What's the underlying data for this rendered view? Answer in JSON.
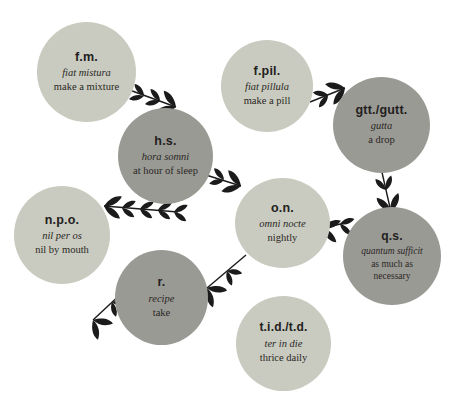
{
  "diagram": {
    "colors": {
      "light_node": "#c9cbc0",
      "dark_node": "#9a9a95",
      "text": "#2a2724",
      "background": "#ffffff",
      "arrow": "#1b1b1b"
    },
    "nodes": [
      {
        "id": "fm",
        "abbr": "f.m.",
        "latin": "fiat mistura",
        "english": "make a mixture",
        "shade": "light"
      },
      {
        "id": "fpil",
        "abbr": "f.pil.",
        "latin": "fiat pillula",
        "english": "make a pill",
        "shade": "light"
      },
      {
        "id": "gtt",
        "abbr": "gtt./gutt.",
        "latin": "gutta",
        "english": "a drop",
        "shade": "dark"
      },
      {
        "id": "hs",
        "abbr": "h.s.",
        "latin": "hora somni",
        "english": "at hour of sleep",
        "shade": "dark"
      },
      {
        "id": "on",
        "abbr": "o.n.",
        "latin": "omni nocte",
        "english": "nightly",
        "shade": "light"
      },
      {
        "id": "qs",
        "abbr": "q.s.",
        "latin": "quantum sufficit",
        "english": "as much as necessary",
        "english_line1": "as much as",
        "english_line2": "necessary",
        "shade": "dark"
      },
      {
        "id": "npo",
        "abbr": "n.p.o.",
        "latin": "nil per os",
        "english": "nil by mouth",
        "shade": "light"
      },
      {
        "id": "r",
        "abbr": "r.",
        "latin": "recipe",
        "english": "take",
        "shade": "dark"
      },
      {
        "id": "tid",
        "abbr": "t.i.d./t.d.",
        "latin": "ter in die",
        "english": "thrice daily",
        "shade": "light"
      }
    ],
    "connectors": [
      {
        "id": "fm-to-hs",
        "from": "f.m.",
        "to": "h.s.",
        "style": "vine-arrow",
        "direction": "right-down"
      },
      {
        "id": "fpil-to-gtt",
        "from": "f.pil.",
        "to": "gtt./gutt.",
        "style": "vine-arrow",
        "direction": "right"
      },
      {
        "id": "gtt-to-qs",
        "from": "gtt./gutt.",
        "to": "q.s.",
        "style": "vine-arrow",
        "direction": "down"
      },
      {
        "id": "hs-to-on",
        "from": "h.s.",
        "to": "o.n.",
        "style": "vine-arrow",
        "direction": "right-down"
      },
      {
        "id": "qs-to-on",
        "from": "q.s.",
        "to": "o.n.",
        "style": "vine-arrow",
        "direction": "left"
      },
      {
        "id": "hs-to-npo",
        "from": "h.s.",
        "to": "n.p.o.",
        "style": "vine-arrow",
        "direction": "left"
      },
      {
        "id": "on-to-r",
        "from": "o.n.",
        "to": "r.",
        "style": "vine-arrow",
        "direction": "left-down"
      },
      {
        "id": "r-to-out",
        "from": "r.",
        "to": "n.p.o.",
        "style": "vine-arrow",
        "direction": "left-down"
      }
    ]
  }
}
